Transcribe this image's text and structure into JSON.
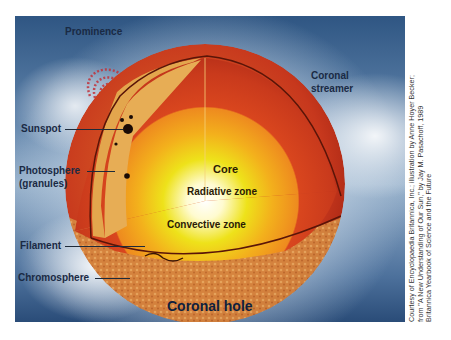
{
  "diagram": {
    "labels": {
      "prominence": "Prominence",
      "coronal_streamer_1": "Coronal",
      "coronal_streamer_2": "streamer",
      "sunspot": "Sunspot",
      "photosphere_1": "Photosphere",
      "photosphere_2": "(granules)",
      "core": "Core",
      "radiative_zone": "Radiative zone",
      "convective_zone": "Convective zone",
      "filament": "Filament",
      "chromosphere": "Chromosphere",
      "coronal_hole": "Coronal hole"
    },
    "credit": {
      "line1": "Courtesy of Encyclopaedia Britannica, Inc.; illustration by Anne Hoyer Becker;",
      "line2": "from \"A New Understanding of Our Sun,\" by Jay M. Pasachoff, 1989",
      "line3": "Britannica Yearbook of Science and the Future"
    },
    "colors": {
      "corona_dark": "#2f5683",
      "surface_red": "#c8361c",
      "photosphere_tan": "#e3a64d",
      "convective_orange": "#e8641e",
      "radiative_yellow": "#f3c21a",
      "core_white": "#fffbe0",
      "text_dark": "#1a2a44"
    }
  }
}
